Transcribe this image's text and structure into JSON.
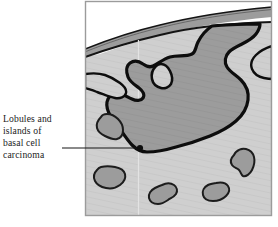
{
  "figure": {
    "kind": "medical-illustration",
    "annotation": {
      "label_lines": [
        "Lobules and",
        "islands of",
        "basal cell",
        "carcinoma"
      ],
      "label_full": "Lobules and islands of basal cell carcinoma",
      "leader_line": {
        "from_x": 62,
        "to_x": 140,
        "y": 148
      },
      "pointer_dot": {
        "x": 140,
        "y": 148,
        "radius": 3.1
      }
    },
    "frame": {
      "left": 85,
      "top": 1,
      "right": 272,
      "bottom": 216,
      "border_color": "#9b9b9b"
    },
    "colors": {
      "page_background": "#ffffff",
      "dermis_fill": "#cfcfcf",
      "tumor_fill": "#9c9c9c",
      "epidermis_fill": "#9c9c9c",
      "outline_dark": "#111111",
      "island_outline": "#1c1c1c",
      "hatch_line": "#b6b6b6",
      "tumor_hatch_line": "#8b8b8b",
      "text_color": "#1a1a1a",
      "frame_border": "#9b9b9b",
      "guide_line": "#e6e6e6"
    },
    "layers": [
      {
        "name": "stratum-corneum-line",
        "description": "thin dark line at skin surface"
      },
      {
        "name": "epidermis-band",
        "description": "grey band beneath the surface line"
      },
      {
        "name": "dermis",
        "description": "light grey field filling the block"
      },
      {
        "name": "tumor-mass",
        "description": "large lobulated dark grey mass with thick black border"
      },
      {
        "name": "tumor-islands",
        "description": "separate rounded nests of carcinoma in the dermis"
      }
    ],
    "island_count": 5
  }
}
